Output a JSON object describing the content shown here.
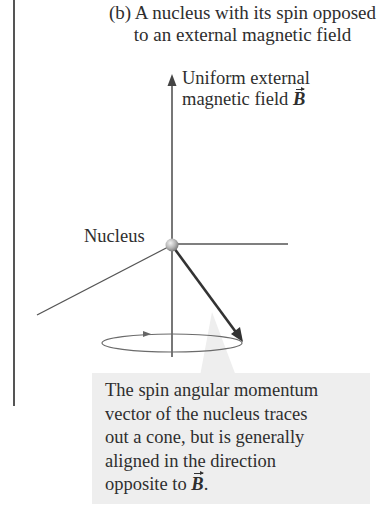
{
  "title": {
    "line1": "(b) A nucleus with its spin opposed",
    "line2": "to an external magnetic field"
  },
  "field_label": {
    "line1": "Uniform external",
    "line2_prefix": "magnetic field ",
    "symbol": "B"
  },
  "nucleus_label": "Nucleus",
  "callout": {
    "lines": [
      "The spin angular momentum",
      "vector of the nucleus traces",
      "out a cone, but is generally",
      "aligned in the direction"
    ],
    "last_line_prefix": "opposite to ",
    "last_line_symbol": "B",
    "last_line_suffix": "."
  },
  "colors": {
    "axis": "#555555",
    "spin_vector": "#333333",
    "callout_bg": "#eeeeee",
    "nucleus": "#b0b0b0"
  }
}
